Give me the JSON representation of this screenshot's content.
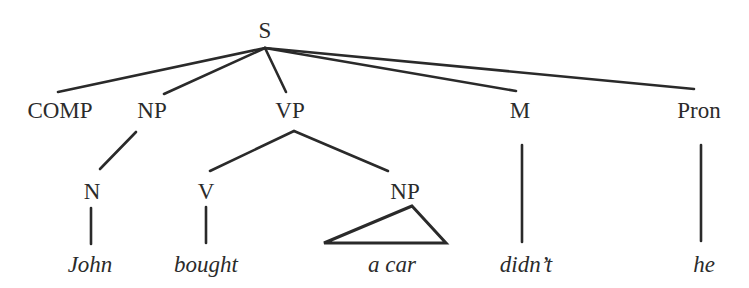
{
  "diagram": {
    "type": "syntax-tree",
    "nodes": {
      "s": {
        "label": "S"
      },
      "comp": {
        "label": "COMP"
      },
      "np1": {
        "label": "NP"
      },
      "vp": {
        "label": "VP"
      },
      "m": {
        "label": "M"
      },
      "pron": {
        "label": "Pron"
      },
      "n": {
        "label": "N"
      },
      "v": {
        "label": "V"
      },
      "np2": {
        "label": "NP"
      }
    },
    "words": {
      "john": "John",
      "bought": "bought",
      "a_car": "a car",
      "didnt": "didn’t",
      "he": "he"
    },
    "edges": [
      [
        "S",
        "COMP"
      ],
      [
        "S",
        "NP"
      ],
      [
        "S",
        "VP"
      ],
      [
        "S",
        "M"
      ],
      [
        "S",
        "Pron"
      ],
      [
        "NP",
        "N"
      ],
      [
        "VP",
        "V"
      ],
      [
        "VP",
        "NP"
      ],
      [
        "N",
        "John"
      ],
      [
        "V",
        "bought"
      ],
      [
        "NP",
        "a car (triangle)"
      ],
      [
        "M",
        "didn’t"
      ],
      [
        "Pron",
        "he"
      ]
    ],
    "colors": {
      "ink": "#2a2a2a",
      "background": "#ffffff"
    }
  }
}
